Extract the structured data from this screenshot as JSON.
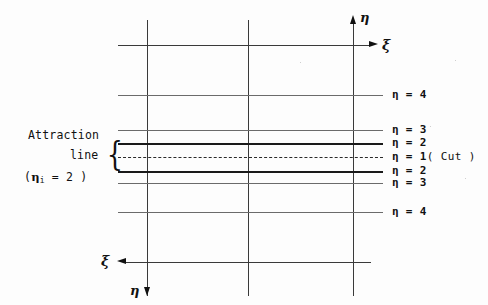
{
  "figure": {
    "type": "grid-diagram",
    "width": 488,
    "height": 305,
    "background": "#fdfdfd",
    "line_color": "#3a3a3a"
  },
  "axes": {
    "top": {
      "eta_label": "η",
      "xi_label": "ξ",
      "eta_arrow": "arrow-up",
      "xi_arrow": "arrow-right"
    },
    "bottom": {
      "eta_label": "η",
      "xi_label": "ξ",
      "eta_arrow": "arrow-down",
      "xi_arrow": "arrow-left"
    }
  },
  "annotation": {
    "line1": "Attraction",
    "line2": "line",
    "brace": "{",
    "line3_prefix": "(",
    "line3_eta": "η",
    "line3_sub": "i",
    "line3_rest": "= 2 )"
  },
  "grid": {
    "vertical_lines": [
      {
        "name": "v1",
        "x": 147,
        "y_top": 20,
        "y_bottom": 296
      },
      {
        "name": "v2",
        "x": 248,
        "y_top": 20,
        "y_bottom": 296
      },
      {
        "name": "v3",
        "x": 353,
        "y_top": 20,
        "y_bottom": 296
      }
    ],
    "horizontal_lines": [
      {
        "name": "xi-axis-top",
        "y": 45,
        "weight": "medium",
        "label": "",
        "label_text": "ξ"
      },
      {
        "name": "eta-4-upper",
        "y": 95,
        "weight": "thin",
        "label": "η = 4"
      },
      {
        "name": "eta-3-upper",
        "y": 130,
        "weight": "thin",
        "label": "η = 3"
      },
      {
        "name": "eta-2-upper",
        "y": 143,
        "weight": "bold",
        "label": "η = 2"
      },
      {
        "name": "eta-1-cut",
        "y": 157,
        "weight": "dashed",
        "label": "η = 1",
        "suffix": "( Cut )"
      },
      {
        "name": "eta-2-lower",
        "y": 171,
        "weight": "bold",
        "label": "η = 2"
      },
      {
        "name": "eta-3-lower",
        "y": 183,
        "weight": "thin",
        "label": "η = 3"
      },
      {
        "name": "eta-4-lower",
        "y": 212,
        "weight": "thin",
        "label": "η = 4"
      },
      {
        "name": "xi-axis-bottom",
        "y": 262,
        "weight": "medium",
        "label": "",
        "label_text": "ξ"
      }
    ]
  },
  "labels": {
    "eta_4_upper": "η = 4",
    "eta_3_upper": "η = 3",
    "eta_2_upper": "η = 2",
    "eta_1_cut": "η = 1",
    "cut_note": "( Cut )",
    "eta_2_lower": "η = 2",
    "eta_3_lower": "η = 3",
    "eta_4_lower": "η = 4"
  }
}
